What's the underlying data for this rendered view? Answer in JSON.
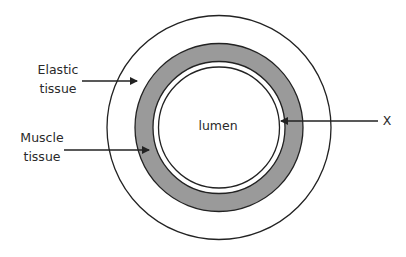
{
  "diagram": {
    "labels": {
      "elastic_line1": "Elastic",
      "elastic_line2": "tissue",
      "muscle_line1": "Muscle",
      "muscle_line2": "tissue",
      "lumen": "lumen",
      "x": "X"
    },
    "colors": {
      "stroke": "#222222",
      "muscle_fill": "#9a9a9a",
      "background": "#ffffff"
    },
    "layers": [
      {
        "name": "elastic tissue (outer wall)",
        "radius": 112
      },
      {
        "name": "muscle tissue",
        "outer_radius": 84,
        "inner_radius": 66
      },
      {
        "name": "layer X (inner lining)",
        "radius": 61
      },
      {
        "name": "lumen"
      }
    ]
  }
}
